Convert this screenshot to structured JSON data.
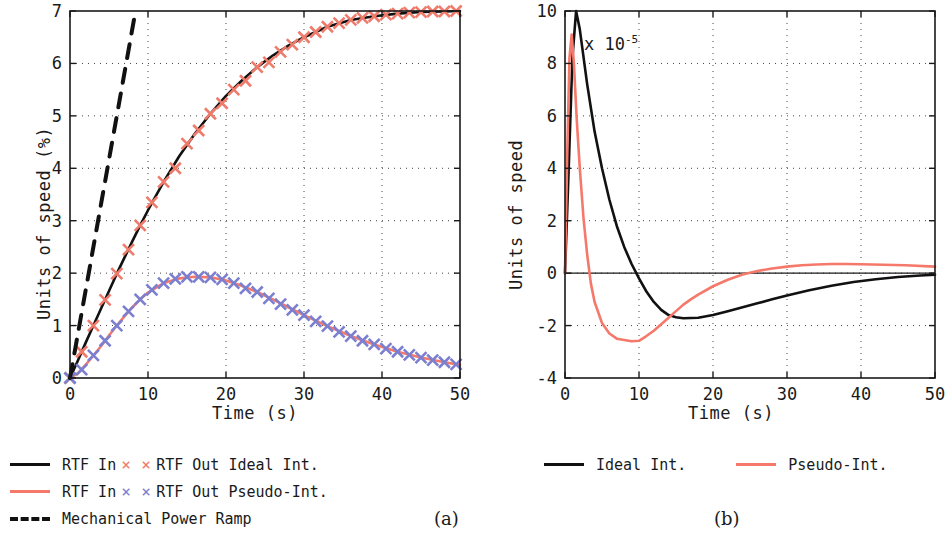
{
  "figure": {
    "panels": [
      {
        "id": "a",
        "sublabel": "(a)",
        "xlabel": "Time (s)",
        "ylabel": "Units of speed (%)",
        "xticks": [
          "0",
          "10",
          "20",
          "30",
          "40",
          "50"
        ],
        "yticks": [
          "0",
          "1",
          "2",
          "3",
          "4",
          "5",
          "6",
          "7"
        ]
      },
      {
        "id": "b",
        "sublabel": "(b)",
        "xlabel": "Time (s)",
        "ylabel": "Units of speed",
        "exponent_prefix": "x 10",
        "exponent_power": "-5",
        "xticks": [
          "0",
          "10",
          "20",
          "30",
          "40",
          "50"
        ],
        "yticks": [
          "-4",
          "-2",
          "0",
          "2",
          "4",
          "6",
          "8",
          "10"
        ]
      }
    ],
    "legend_a": [
      {
        "swatch": "line-black",
        "label": "RTF In",
        "swatch2": "x-red",
        "label2": "RTF Out Ideal Int."
      },
      {
        "swatch": "line-red",
        "label": "RTF In",
        "swatch2": "x-blue",
        "label2": "RTF Out Pseudo-Int."
      },
      {
        "swatch": "dash-black",
        "label": "Mechanical Power Ramp",
        "swatch2": "",
        "label2": ""
      }
    ],
    "legend_b": [
      {
        "swatch": "line-black",
        "label": "Ideal Int."
      },
      {
        "swatch": "line-red",
        "label": "Pseudo-Int."
      }
    ],
    "colors": {
      "black": "#111111",
      "red": "#F4796B",
      "marker_red": "#EE7B6B",
      "marker_blue": "#7B7FD0",
      "grid": "#555555",
      "axis": "#1a1a1a"
    }
  },
  "chart_data": [
    {
      "type": "line",
      "title": "(a)",
      "xlabel": "Time (s)",
      "ylabel": "Units of speed (%)",
      "xlim": [
        0,
        50
      ],
      "ylim": [
        0,
        7
      ],
      "xticks": [
        0,
        10,
        20,
        30,
        40,
        50
      ],
      "yticks": [
        0,
        1,
        2,
        3,
        4,
        5,
        6,
        7
      ],
      "grid": true,
      "legend_position": "below-figure",
      "series": [
        {
          "name": "RTF In (Ideal Int.)",
          "color": "#111111",
          "style": "solid",
          "x": [
            0,
            1,
            2,
            3,
            4,
            5,
            6,
            7,
            8,
            9,
            10,
            12,
            14,
            16,
            18,
            20,
            22,
            24,
            26,
            28,
            30,
            33,
            36,
            39,
            42,
            45,
            48,
            50
          ],
          "y": [
            0,
            0.33,
            0.67,
            1.0,
            1.33,
            1.66,
            1.99,
            2.3,
            2.61,
            2.91,
            3.2,
            3.74,
            4.23,
            4.66,
            5.04,
            5.38,
            5.67,
            5.93,
            6.15,
            6.34,
            6.5,
            6.7,
            6.83,
            6.9,
            6.95,
            6.98,
            6.99,
            7.0
          ]
        },
        {
          "name": "RTF Out Ideal Int.",
          "color": "#EE7B6B",
          "style": "markers-x",
          "x": [
            0,
            1.5,
            3,
            4.5,
            6,
            7.5,
            9,
            10.5,
            12,
            13.5,
            15,
            16.5,
            18,
            19.5,
            21,
            22.5,
            24,
            25.5,
            27,
            28.5,
            30,
            31.5,
            33,
            34.5,
            36,
            37.5,
            39,
            40.5,
            42,
            43.5,
            45,
            46.5,
            48,
            49.5
          ],
          "y": [
            0,
            0.5,
            1.0,
            1.49,
            1.99,
            2.45,
            2.91,
            3.35,
            3.74,
            4.0,
            4.47,
            4.72,
            5.04,
            5.24,
            5.5,
            5.67,
            5.93,
            6.02,
            6.22,
            6.36,
            6.5,
            6.6,
            6.7,
            6.77,
            6.83,
            6.87,
            6.9,
            6.93,
            6.95,
            6.97,
            6.98,
            6.99,
            6.99,
            7.0
          ]
        },
        {
          "name": "RTF In (Pseudo-Int.)",
          "color": "#F4796B",
          "style": "solid",
          "x": [
            0,
            1,
            2,
            3,
            4,
            5,
            6,
            7,
            8,
            9,
            10,
            12,
            14,
            16,
            18,
            20,
            22,
            24,
            26,
            28,
            30,
            33,
            36,
            39,
            42,
            45,
            48,
            50
          ],
          "y": [
            0,
            0.09,
            0.25,
            0.43,
            0.61,
            0.81,
            1.0,
            1.18,
            1.35,
            1.5,
            1.63,
            1.81,
            1.9,
            1.93,
            1.92,
            1.86,
            1.76,
            1.64,
            1.5,
            1.35,
            1.2,
            0.99,
            0.8,
            0.64,
            0.5,
            0.39,
            0.3,
            0.25
          ]
        },
        {
          "name": "RTF Out Pseudo-Int.",
          "color": "#7B7FD0",
          "style": "markers-x",
          "x": [
            0,
            1.5,
            3,
            4.5,
            6,
            7.5,
            9,
            10.5,
            12,
            13.5,
            15,
            16.5,
            18,
            19.5,
            21,
            22.5,
            24,
            25.5,
            27,
            28.5,
            30,
            31.5,
            33,
            34.5,
            36,
            37.5,
            39,
            40.5,
            42,
            43.5,
            45,
            46.5,
            48,
            49.5
          ],
          "y": [
            0,
            0.16,
            0.43,
            0.71,
            1.0,
            1.27,
            1.5,
            1.68,
            1.81,
            1.89,
            1.93,
            1.93,
            1.92,
            1.88,
            1.81,
            1.71,
            1.64,
            1.52,
            1.41,
            1.3,
            1.2,
            1.08,
            0.99,
            0.88,
            0.8,
            0.71,
            0.64,
            0.56,
            0.5,
            0.44,
            0.39,
            0.34,
            0.3,
            0.26
          ]
        },
        {
          "name": "Mechanical Power Ramp",
          "color": "#111111",
          "style": "dashed",
          "x": [
            0,
            8.4
          ],
          "y": [
            0,
            7
          ]
        }
      ]
    },
    {
      "type": "line",
      "title": "(b)",
      "xlabel": "Time (s)",
      "ylabel": "Units of speed",
      "y_scale_exponent": -5,
      "xlim": [
        0,
        50
      ],
      "ylim": [
        -4,
        10
      ],
      "xticks": [
        0,
        10,
        20,
        30,
        40,
        50
      ],
      "yticks": [
        -4,
        -2,
        0,
        2,
        4,
        6,
        8,
        10
      ],
      "grid": true,
      "legend_position": "below-figure",
      "series": [
        {
          "name": "Ideal Int.",
          "color": "#111111",
          "style": "solid",
          "x": [
            0,
            0.5,
            1.0,
            1.5,
            2,
            3,
            4,
            5,
            6,
            7,
            8,
            9,
            10,
            11,
            12,
            13,
            14,
            15,
            16,
            18,
            20,
            22,
            24,
            26,
            28,
            30,
            33,
            36,
            39,
            42,
            45,
            48,
            50
          ],
          "y": [
            0,
            4.0,
            8.2,
            10.0,
            9.3,
            7.2,
            5.4,
            4.0,
            2.8,
            1.8,
            1.0,
            0.35,
            -0.2,
            -0.7,
            -1.1,
            -1.4,
            -1.6,
            -1.68,
            -1.72,
            -1.7,
            -1.6,
            -1.45,
            -1.3,
            -1.15,
            -1.0,
            -0.85,
            -0.65,
            -0.48,
            -0.34,
            -0.23,
            -0.15,
            -0.09,
            -0.06
          ]
        },
        {
          "name": "Pseudo-Int.",
          "color": "#F4796B",
          "style": "solid",
          "x": [
            0,
            0.3,
            0.6,
            0.9,
            1.2,
            1.6,
            2,
            2.5,
            3,
            3.5,
            4,
            5,
            6,
            7,
            8,
            9,
            10,
            11,
            12,
            13,
            14,
            15,
            16,
            17,
            18,
            20,
            22,
            24,
            26,
            28,
            30,
            32,
            34,
            36,
            38,
            40,
            43,
            46,
            50
          ],
          "y": [
            0,
            4.5,
            8.2,
            9.1,
            8.0,
            5.8,
            4.0,
            2.1,
            0.7,
            -0.4,
            -1.1,
            -1.9,
            -2.3,
            -2.5,
            -2.55,
            -2.6,
            -2.58,
            -2.4,
            -2.2,
            -1.95,
            -1.7,
            -1.45,
            -1.2,
            -1.0,
            -0.82,
            -0.5,
            -0.25,
            -0.05,
            0.08,
            0.18,
            0.25,
            0.3,
            0.33,
            0.35,
            0.35,
            0.34,
            0.32,
            0.3,
            0.25
          ]
        }
      ]
    }
  ]
}
